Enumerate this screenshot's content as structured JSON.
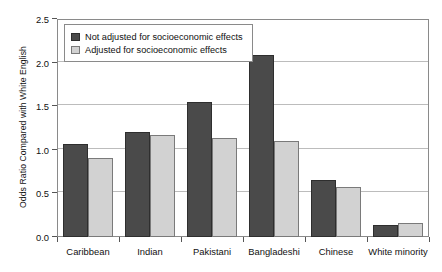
{
  "chart_data": {
    "type": "bar",
    "title": "",
    "xlabel": "",
    "ylabel": "Odds Ratio Compared with White English",
    "categories": [
      "Caribbean",
      "Indian",
      "Pakistani",
      "Bangladeshi",
      "Chinese",
      "White minority"
    ],
    "series": [
      {
        "name": "Not adjusted for socioeconomic effects",
        "color": "#4a4a4a",
        "values": [
          1.07,
          1.21,
          1.55,
          2.09,
          0.65,
          0.14
        ]
      },
      {
        "name": "Adjusted for socioeconomic effects",
        "color": "#d2d2d2",
        "values": [
          0.91,
          1.17,
          1.13,
          1.1,
          0.57,
          0.16
        ]
      }
    ],
    "ylim": [
      0.0,
      2.5
    ],
    "ytick_values": [
      0.0,
      0.5,
      1.0,
      1.5,
      2.0,
      2.5
    ],
    "ytick_labels": [
      "0.0",
      "0.5",
      "1.0",
      "1.5",
      "2.0",
      "2.5"
    ],
    "grid": true,
    "legend_position": "top-left"
  },
  "legend": {
    "items": [
      {
        "label": "Not adjusted for socioeconomic effects",
        "swatch": "dark"
      },
      {
        "label": "Adjusted for socioeconomic effects",
        "swatch": "light"
      }
    ]
  }
}
